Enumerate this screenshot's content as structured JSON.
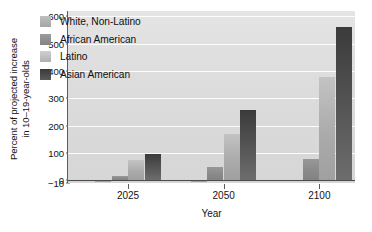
{
  "chart_data": {
    "type": "bar",
    "title": "",
    "subtitle": "",
    "xlabel": "Year",
    "ylabel": "Percent of projected increase in 10–19-year-olds",
    "ylabel_line1": "Percent of projected increase",
    "ylabel_line2": "in 10–19-year-olds",
    "categories": [
      "2025",
      "2050",
      "2100"
    ],
    "series": [
      {
        "name": "White, Non-Latino",
        "values": [
          -8,
          -8,
          0
        ],
        "color": "#a8a8a8"
      },
      {
        "name": "African American",
        "values": [
          15,
          48,
          78
        ],
        "color": "#8c8c8c"
      },
      {
        "name": "Latino",
        "values": [
          75,
          168,
          380
        ],
        "color": "#b5b5b5"
      },
      {
        "name": "Asian American",
        "values": [
          97,
          256,
          560
        ],
        "color": "#4a4a4a"
      }
    ],
    "yticks": [
      600,
      500,
      400,
      300,
      200,
      100,
      0,
      -10
    ],
    "ytick_labels": [
      "600",
      "500",
      "400",
      "300",
      "200",
      "100",
      "0",
      "−10"
    ],
    "ylim": [
      -10,
      620
    ],
    "xticks": [
      "2025",
      "2050",
      "2100"
    ],
    "grid": "horizontal-white",
    "legend_position": "upper-left-inside",
    "plot_background": "#dedede",
    "zero_line_color": "#4a4a4a",
    "axis_color": "#5d5d5d"
  }
}
